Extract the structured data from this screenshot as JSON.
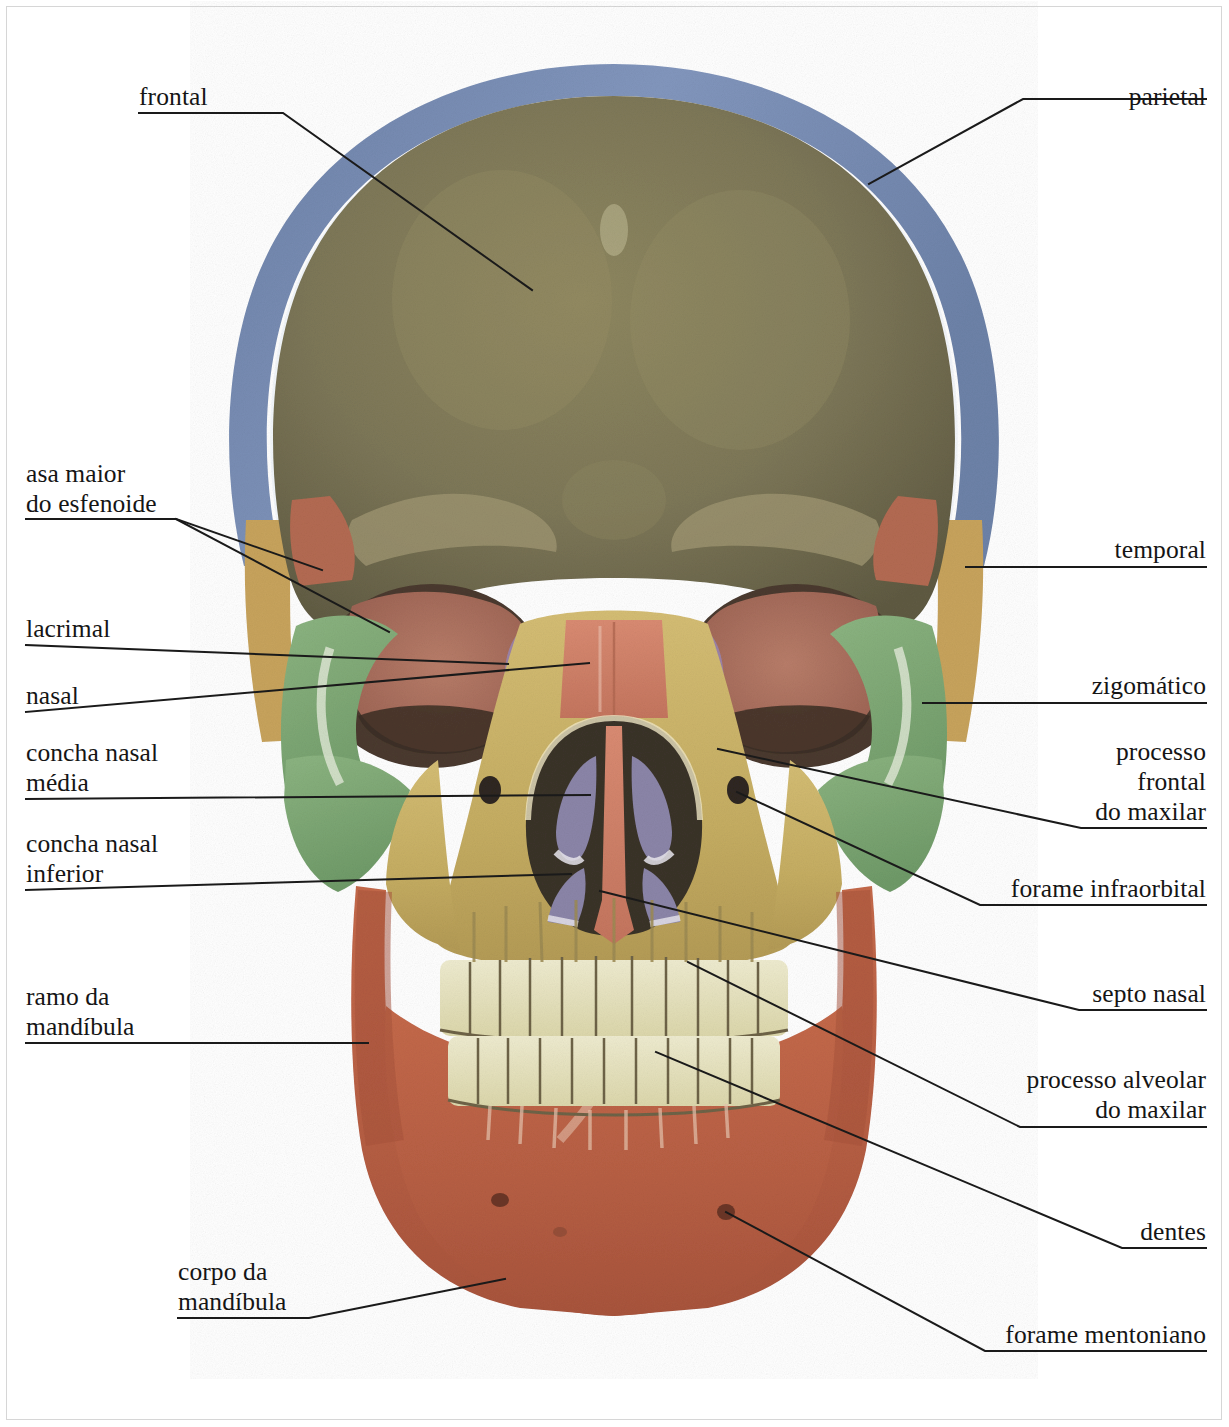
{
  "figure": {
    "palette": {
      "frontal_bone": "#7d7758",
      "parietal_bone": "#7f96bd",
      "temporal_bone": "#c7a35c",
      "sphenoid_greater_wing": "#b36a52",
      "zygomatic_bone": "#7fa876",
      "maxilla": "#cbb469",
      "mandible": "#c2674a",
      "nasal_septum": "#d1816a",
      "nasal_concha": "#8b85a8",
      "lacrimal_bone": "#9b82a6",
      "orbit_cavity": "#b0705f",
      "teeth": "#e8e5c6",
      "nasal_cavity_dark": "#3a3329",
      "leader_line": "#1a1a1a",
      "page_border": "#d6d6d6",
      "text": "#151515",
      "background": "#ffffff"
    }
  },
  "labels": {
    "left": [
      {
        "id": "frontal",
        "text": "frontal"
      },
      {
        "id": "asa-maior",
        "text": "asa maior\ndo esfenoide"
      },
      {
        "id": "lacrimal",
        "text": "lacrimal"
      },
      {
        "id": "nasal",
        "text": "nasal"
      },
      {
        "id": "concha-media",
        "text": "concha nasal\nmédia"
      },
      {
        "id": "concha-inferior",
        "text": "concha nasal\ninferior"
      },
      {
        "id": "ramo",
        "text": "ramo da\nmandíbula"
      },
      {
        "id": "corpo",
        "text": "corpo da\nmandíbula"
      }
    ],
    "right": [
      {
        "id": "parietal",
        "text": "parietal"
      },
      {
        "id": "temporal",
        "text": "temporal"
      },
      {
        "id": "zigomatico",
        "text": "zigomático"
      },
      {
        "id": "processo-frontal",
        "text": "processo\nfrontal\ndo maxilar"
      },
      {
        "id": "forame-infraorbital",
        "text": "forame infraorbital"
      },
      {
        "id": "septo-nasal",
        "text": "septo nasal"
      },
      {
        "id": "processo-alveolar",
        "text": "processo alveolar\ndo maxilar"
      },
      {
        "id": "dentes",
        "text": "dentes"
      },
      {
        "id": "forame-mentoniano",
        "text": "forame mentoniano"
      }
    ]
  }
}
